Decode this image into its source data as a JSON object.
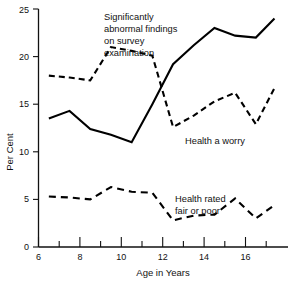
{
  "chart_data": {
    "type": "line",
    "title": "",
    "xlabel": "Age in Years",
    "ylabel": "Per Cent",
    "xlim": [
      6,
      17.5
    ],
    "ylim": [
      0,
      25
    ],
    "grid": false,
    "legend": "inline-annotations",
    "xticks_major": [
      6,
      8,
      10,
      12,
      14,
      16
    ],
    "xticks_minor": [
      7,
      9,
      11,
      13,
      15,
      17
    ],
    "yticks": [
      0,
      5,
      10,
      15,
      20,
      25
    ],
    "x": [
      6.5,
      7.5,
      8.5,
      9.5,
      10.5,
      11.5,
      12.5,
      13.5,
      14.5,
      15.5,
      16.5,
      17.4
    ],
    "series": [
      {
        "name": "Significantly abnormal findings on survey examination",
        "style": "solid",
        "values": [
          13.5,
          14.3,
          12.4,
          11.8,
          11.0,
          15.0,
          19.2,
          21.2,
          23.0,
          22.2,
          22.0,
          24.0
        ]
      },
      {
        "name": "Health a worry",
        "style": "dashed",
        "values": [
          18.0,
          17.8,
          17.5,
          21.0,
          20.6,
          20.1,
          12.6,
          13.8,
          15.3,
          16.2,
          12.9,
          16.7
        ]
      },
      {
        "name": "Health rated fair or poor",
        "style": "dashed",
        "values": [
          5.3,
          5.2,
          5.0,
          6.3,
          5.8,
          5.7,
          2.8,
          3.3,
          3.4,
          5.1,
          3.0,
          4.4
        ]
      }
    ],
    "annotations": [
      {
        "id": "abnormal-findings",
        "lines": [
          "Significantly",
          "abnormal findings",
          "on survey",
          "examination"
        ]
      },
      {
        "id": "health-a-worry",
        "lines": [
          "Health a worry"
        ]
      },
      {
        "id": "health-rated-fair-poor",
        "lines": [
          "Health rated",
          "fair or poor"
        ]
      }
    ]
  },
  "axis": {
    "ylabel": "Per Cent",
    "xlabel": "Age in Years",
    "ytick_labels": [
      "0",
      "5",
      "10",
      "15",
      "20",
      "25"
    ],
    "xtick_labels": [
      "6",
      "8",
      "10",
      "12",
      "14",
      "16"
    ]
  },
  "annotation_text": {
    "abnormal_1": "Significantly",
    "abnormal_2": "abnormal findings",
    "abnormal_3": "on survey",
    "abnormal_4": "examination",
    "worry_1": "Health a worry",
    "fairpoor_1": "Health rated",
    "fairpoor_2": "fair or poor"
  }
}
